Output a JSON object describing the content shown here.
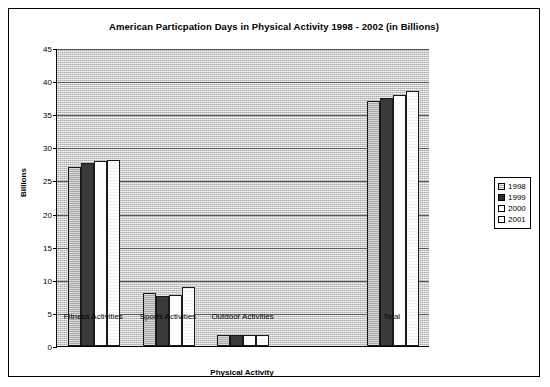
{
  "chart_data": {
    "type": "bar",
    "title": "American Particpation Days in Physical Activity 1998 - 2002 (in Billions)",
    "xlabel": "Physical Activity",
    "ylabel": "Billions",
    "ylim": [
      0,
      45
    ],
    "yticks": [
      0,
      5,
      10,
      15,
      20,
      25,
      30,
      35,
      40,
      45
    ],
    "ytick_labels": [
      "0",
      "5",
      "10",
      "15",
      "20",
      "25",
      "30",
      "35",
      "40",
      "45"
    ],
    "grid": true,
    "legend_position": "right",
    "categories": [
      "Fitness Activities",
      "Sports Activities",
      "Outdoor Activities",
      "Total"
    ],
    "series": [
      {
        "name": "1998",
        "values": [
          27.1,
          8.0,
          1.6,
          37.0
        ]
      },
      {
        "name": "1999",
        "values": [
          27.7,
          7.5,
          1.6,
          37.4
        ]
      },
      {
        "name": "2000",
        "values": [
          28.0,
          7.7,
          1.7,
          37.9
        ]
      },
      {
        "name": "2001",
        "values": [
          28.1,
          8.9,
          1.7,
          38.5
        ]
      }
    ]
  },
  "legend": {
    "items": [
      {
        "label": "1998"
      },
      {
        "label": "1999"
      },
      {
        "label": "2000"
      },
      {
        "label": "2001"
      }
    ]
  }
}
